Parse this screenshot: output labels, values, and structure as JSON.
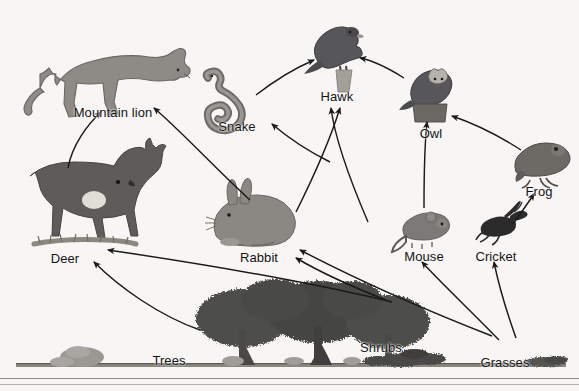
{
  "diagram": {
    "background_color": "#f7f6f4",
    "line_color": "#1a1a1a",
    "label_color": "#141414",
    "organisms": [
      {
        "id": "mountain-lion",
        "label": "Mountain lion",
        "label_x": 113,
        "label_y": 105,
        "art_x": 108,
        "art_y": 62,
        "art_w": 150,
        "art_h": 78,
        "kind": "cat",
        "fill": "#8e8b86"
      },
      {
        "id": "snake",
        "label": "Snake",
        "label_x": 237,
        "label_y": 119,
        "art_x": 233,
        "art_y": 90,
        "art_w": 70,
        "art_h": 48,
        "kind": "snake",
        "fill": "#8e8b86"
      },
      {
        "id": "hawk",
        "label": "Hawk",
        "label_x": 337,
        "label_y": 89,
        "art_x": 337,
        "art_y": 50,
        "art_w": 62,
        "art_h": 62,
        "kind": "hawk",
        "fill": "#57565a"
      },
      {
        "id": "owl",
        "label": "Owl",
        "label_x": 431,
        "label_y": 126,
        "art_x": 431,
        "art_y": 90,
        "art_w": 52,
        "art_h": 58,
        "kind": "owl",
        "fill": "#57565a"
      },
      {
        "id": "frog",
        "label": "Frog",
        "label_x": 539,
        "label_y": 184,
        "art_x": 538,
        "art_y": 156,
        "art_w": 54,
        "art_h": 40,
        "kind": "frog",
        "fill": "#6d6a66"
      },
      {
        "id": "deer",
        "label": "Deer",
        "label_x": 65,
        "label_y": 251,
        "art_x": 80,
        "art_y": 196,
        "art_w": 118,
        "art_h": 96,
        "kind": "deer",
        "fill": "#5e5c5a"
      },
      {
        "id": "rabbit",
        "label": "Rabbit",
        "label_x": 259,
        "label_y": 250,
        "art_x": 254,
        "art_y": 212,
        "art_w": 86,
        "art_h": 58,
        "kind": "rabbit",
        "fill": "#8b8884"
      },
      {
        "id": "mouse",
        "label": "Mouse",
        "label_x": 424,
        "label_y": 249,
        "art_x": 424,
        "art_y": 222,
        "art_w": 56,
        "art_h": 36,
        "kind": "mouse",
        "fill": "#7c7a76"
      },
      {
        "id": "cricket",
        "label": "Cricket",
        "label_x": 496,
        "label_y": 249,
        "art_x": 495,
        "art_y": 224,
        "art_w": 44,
        "art_h": 28,
        "kind": "cricket",
        "fill": "#2b2b2b"
      },
      {
        "id": "trees",
        "label": "Trees",
        "label_x": 169,
        "label_y": 353,
        "art_x": 300,
        "art_y": 330,
        "art_w": 210,
        "art_h": 86,
        "kind": "trees",
        "fill": "#4a4a48"
      },
      {
        "id": "shrubs",
        "label": "Shrubs",
        "label_x": 381,
        "label_y": 340,
        "art_x": 402,
        "art_y": 358,
        "art_w": 86,
        "art_h": 20,
        "kind": "shrubs",
        "fill": "#4a4a48"
      },
      {
        "id": "grasses",
        "label": "Grasses",
        "label_x": 505,
        "label_y": 355,
        "art_x": 545,
        "art_y": 362,
        "art_w": 46,
        "art_h": 14,
        "kind": "grasses",
        "fill": "#4a4a48"
      }
    ],
    "ground": {
      "y": 366,
      "left": 16,
      "right": 566
    },
    "bottom_rule_y": 379,
    "food_chain_links": [
      {
        "from": "deer",
        "to": "mountain-lion",
        "path": "M 68,168 C 72,145 88,124 101,112"
      },
      {
        "from": "rabbit",
        "to": "mountain-lion",
        "path": "M 250,200 C 215,168 180,130 154,108"
      },
      {
        "from": "snake",
        "to": "hawk",
        "path": "M 256,95 C 278,78 300,66 314,60"
      },
      {
        "from": "owl",
        "to": "hawk",
        "path": "M 404,78 C 385,66 370,60 360,58"
      },
      {
        "from": "rabbit",
        "to": "hawk",
        "path": "M 368,222 C 350,180 335,140 331,108"
      },
      {
        "from": "mouse",
        "to": "hawk",
        "path": "M 296,212 C 312,180 330,140 340,108"
      },
      {
        "from": "mouse",
        "to": "snake",
        "path": "M 330,162 C 306,150 286,136 272,124"
      },
      {
        "from": "mouse",
        "to": "owl",
        "path": "M 424,208 C 424,180 424,150 427,122"
      },
      {
        "from": "frog",
        "to": "owl",
        "path": "M 521,150 C 496,134 470,122 452,116"
      },
      {
        "from": "cricket",
        "to": "frog",
        "path": "M 513,224 C 523,210 530,200 534,194"
      },
      {
        "from": "trees",
        "to": "deer",
        "path": "M 200,330 C 160,316 120,288 94,262"
      },
      {
        "from": "shrubs",
        "to": "deer",
        "path": "M 392,302 C 300,280 190,262 108,250"
      },
      {
        "from": "shrubs",
        "to": "rabbit",
        "path": "M 386,300 C 350,286 320,272 296,258"
      },
      {
        "from": "grasses",
        "to": "rabbit",
        "path": "M 492,336 C 420,308 350,276 300,250"
      },
      {
        "from": "grasses",
        "to": "mouse",
        "path": "M 499,340 C 470,310 440,282 422,262"
      },
      {
        "from": "grasses",
        "to": "cricket",
        "path": "M 516,338 C 506,310 498,282 494,262"
      }
    ]
  }
}
